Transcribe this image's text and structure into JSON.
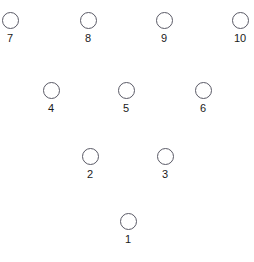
{
  "canvas": {
    "width": 254,
    "height": 262,
    "background": "#ffffff"
  },
  "style": {
    "circle_diameter": 17,
    "circle_stroke_color": "#5a5a66",
    "circle_stroke_width": 1,
    "circle_fill": "transparent",
    "label_color": "#1a1a1a",
    "label_font_size": 11,
    "label_offset_y": 4
  },
  "diagram": {
    "type": "node-layout",
    "node_count": 10,
    "rows": [
      {
        "row_index": 0,
        "y": 20,
        "node_ids": [
          7,
          8,
          9,
          10
        ]
      },
      {
        "row_index": 1,
        "y": 90,
        "node_ids": [
          4,
          5,
          6
        ]
      },
      {
        "row_index": 2,
        "y": 156,
        "node_ids": [
          2,
          3
        ]
      },
      {
        "row_index": 3,
        "y": 221,
        "node_ids": [
          1
        ]
      }
    ]
  },
  "nodes": [
    {
      "id": 1,
      "label": "1",
      "cx": 128,
      "cy": 221
    },
    {
      "id": 2,
      "label": "2",
      "cx": 90,
      "cy": 156
    },
    {
      "id": 3,
      "label": "3",
      "cx": 165,
      "cy": 156
    },
    {
      "id": 4,
      "label": "4",
      "cx": 51,
      "cy": 90
    },
    {
      "id": 5,
      "label": "5",
      "cx": 126,
      "cy": 90
    },
    {
      "id": 6,
      "label": "6",
      "cx": 203,
      "cy": 90
    },
    {
      "id": 7,
      "label": "7",
      "cx": 10,
      "cy": 20
    },
    {
      "id": 8,
      "label": "8",
      "cx": 88,
      "cy": 20
    },
    {
      "id": 9,
      "label": "9",
      "cx": 164,
      "cy": 20
    },
    {
      "id": 10,
      "label": "10",
      "cx": 240,
      "cy": 20
    }
  ]
}
